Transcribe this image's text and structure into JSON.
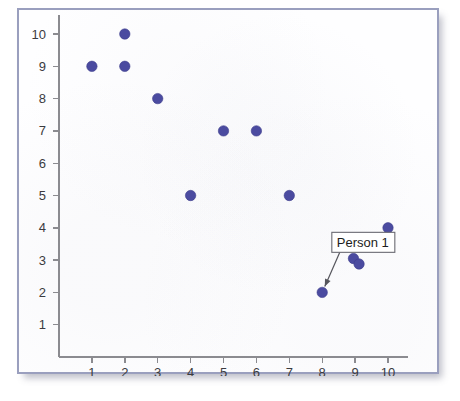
{
  "figure": {
    "kind": "scatter-plot-figure",
    "frame_border_color": "#9a9fbe",
    "paper_color": "#fefeff"
  },
  "chart_data": {
    "type": "scatter",
    "title": "",
    "subtitle": "",
    "xlabel": "",
    "ylabel": "",
    "xlim": [
      0,
      10.6
    ],
    "ylim": [
      0,
      10.6
    ],
    "grid": false,
    "legend": "none",
    "marker_color": "#4b4ba0",
    "marker_shape": "circle",
    "marker_radius": 5.2,
    "xticks": [
      1,
      2,
      3,
      4,
      5,
      6,
      7,
      8,
      9,
      10
    ],
    "yticks": [
      1,
      2,
      3,
      4,
      5,
      6,
      7,
      8,
      9,
      10
    ],
    "xtick_labels": [
      "1",
      "2",
      "3",
      "4",
      "5",
      "6",
      "7",
      "8",
      "9",
      "10"
    ],
    "ytick_labels": [
      "1",
      "2",
      "3",
      "4",
      "5",
      "6",
      "7",
      "8",
      "9",
      "10"
    ],
    "points": [
      {
        "x": 1,
        "y": 9
      },
      {
        "x": 2,
        "y": 10
      },
      {
        "x": 2,
        "y": 9
      },
      {
        "x": 3,
        "y": 8
      },
      {
        "x": 4,
        "y": 5
      },
      {
        "x": 5,
        "y": 7
      },
      {
        "x": 6,
        "y": 7
      },
      {
        "x": 7,
        "y": 5
      },
      {
        "x": 8,
        "y": 2
      },
      {
        "x": 8.95,
        "y": 3.05
      },
      {
        "x": 9.12,
        "y": 2.88
      },
      {
        "x": 10,
        "y": 4
      }
    ],
    "annotations": [
      {
        "label": "Person 1",
        "points_to": {
          "x": 8,
          "y": 2
        },
        "box": {
          "x": 9.25,
          "y": 3.55
        }
      }
    ]
  }
}
